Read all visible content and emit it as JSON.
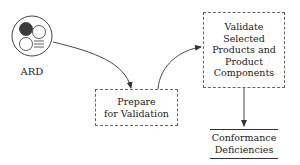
{
  "diagram": {
    "type": "process-flow",
    "nodes": {
      "ard": {
        "label": "ARD",
        "icon": "ard-document-icon",
        "kind": "external-entity"
      },
      "prepare": {
        "line1": "Prepare",
        "line2": "for Validation",
        "kind": "process"
      },
      "validate": {
        "line1": "Validate",
        "line2": "Selected",
        "line3": "Products and",
        "line4": "Product",
        "line5": "Components",
        "kind": "process"
      },
      "conformance": {
        "line1": "Conformance",
        "line2": "Deficiencies",
        "kind": "data-store"
      }
    },
    "edges": [
      {
        "from": "ARD",
        "to": "Prepare for Validation"
      },
      {
        "from": "Prepare for Validation",
        "to": "Validate Selected Products and Product Components"
      },
      {
        "from": "Validate Selected Products and Product Components",
        "to": "Conformance Deficiencies"
      }
    ],
    "colors": {
      "stroke": "#333333",
      "dashed_border": "#666666",
      "icon_fill": "#3a3a3a",
      "text": "#222222"
    }
  }
}
